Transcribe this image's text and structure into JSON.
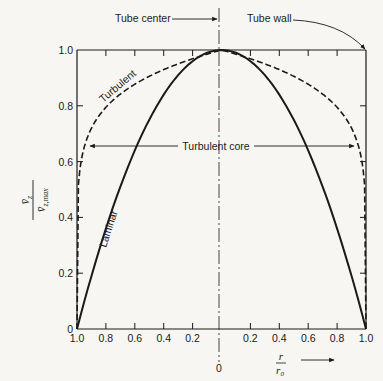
{
  "chart_data": {
    "type": "line",
    "title": "",
    "xlabel": "r / r0",
    "ylabel": "v̄z / v̄z,max",
    "xlim": [
      -1.0,
      1.0
    ],
    "ylim": [
      0,
      1.0
    ],
    "x_tick_labels": [
      "1.0",
      "0.8",
      "0.6",
      "0.4",
      "0.2",
      "0",
      "0.2",
      "0.4",
      "0.6",
      "0.8",
      "1.0"
    ],
    "x_ticks": [
      -1.0,
      -0.8,
      -0.6,
      -0.4,
      -0.2,
      0,
      0.2,
      0.4,
      0.6,
      0.8,
      1.0
    ],
    "y_tick_labels": [
      "0",
      "0.2",
      "0.4",
      "0.6",
      "0.8",
      "1.0"
    ],
    "y_ticks": [
      0,
      0.2,
      0.4,
      0.6,
      0.8,
      1.0
    ],
    "grid": false,
    "series": [
      {
        "name": "Laminar",
        "style": "solid",
        "x": [
          -1.0,
          -0.8,
          -0.6,
          -0.4,
          -0.2,
          0,
          0.2,
          0.4,
          0.6,
          0.8,
          1.0
        ],
        "y": [
          0.0,
          0.36,
          0.64,
          0.84,
          0.96,
          1.0,
          0.96,
          0.84,
          0.64,
          0.36,
          0.0
        ]
      },
      {
        "name": "Turbulent",
        "style": "dashed",
        "x": [
          -1.0,
          -0.99,
          -0.95,
          -0.9,
          -0.8,
          -0.6,
          -0.4,
          -0.2,
          0,
          0.2,
          0.4,
          0.6,
          0.8,
          0.9,
          0.95,
          0.99,
          1.0
        ],
        "y": [
          0.0,
          0.45,
          0.6,
          0.68,
          0.77,
          0.87,
          0.93,
          0.98,
          1.0,
          0.98,
          0.93,
          0.87,
          0.77,
          0.68,
          0.6,
          0.45,
          0.0
        ]
      }
    ],
    "annotations": [
      {
        "text": "Tube center",
        "arrow_to": "x=0 at top"
      },
      {
        "text": "Tube wall",
        "arrow_to": "x=1.0, y=1.0 corner"
      },
      {
        "text": "Turbulent core",
        "span": [
          -0.95,
          0.95
        ],
        "y": 0.66
      },
      {
        "text": "Turbulent",
        "near": "dashed curve, left"
      },
      {
        "text": "Laminar",
        "near": "solid curve, left"
      }
    ]
  },
  "labels": {
    "tube_center": "Tube center",
    "tube_wall": "Tube wall",
    "turbulent_core": "Turbulent core",
    "turbulent": "Turbulent",
    "laminar": "Laminar",
    "y_num": "v̄",
    "y_num_sub": "z",
    "y_den": "v̄",
    "y_den_sub": "z,max",
    "x_num": "r",
    "x_den": "r",
    "x_den_sub": "0",
    "x_zero": "0"
  },
  "colors": {
    "ink": "#1a1a1a",
    "paper": "#f7f6f3"
  }
}
